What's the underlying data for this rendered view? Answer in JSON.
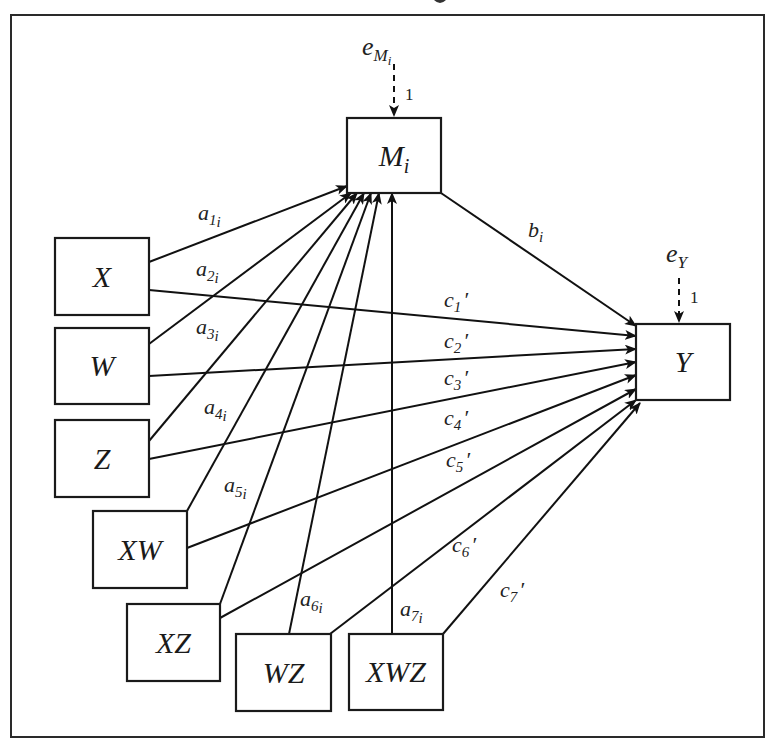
{
  "diagram": {
    "title_fragment": "",
    "frame": {
      "x": 11,
      "y": 15,
      "width": 753,
      "height": 722
    },
    "nodes": [
      {
        "id": "M",
        "label": "M",
        "sub": "i",
        "x": 347,
        "y": 118,
        "w": 94,
        "h": 75
      },
      {
        "id": "Y",
        "label": "Y",
        "sub": "",
        "x": 636,
        "y": 324,
        "w": 94,
        "h": 76
      },
      {
        "id": "X",
        "label": "X",
        "sub": "",
        "x": 55,
        "y": 238,
        "w": 94,
        "h": 77
      },
      {
        "id": "W",
        "label": "W",
        "sub": "",
        "x": 55,
        "y": 328,
        "w": 94,
        "h": 76
      },
      {
        "id": "Z",
        "label": "Z",
        "sub": "",
        "x": 55,
        "y": 420,
        "w": 94,
        "h": 77
      },
      {
        "id": "XW",
        "label": "XW",
        "sub": "",
        "x": 93,
        "y": 511,
        "w": 94,
        "h": 77
      },
      {
        "id": "XZ",
        "label": "XZ",
        "sub": "",
        "x": 127,
        "y": 604,
        "w": 93,
        "h": 77
      },
      {
        "id": "WZ",
        "label": "WZ",
        "sub": "",
        "x": 236,
        "y": 634,
        "w": 95,
        "h": 77
      },
      {
        "id": "XWZ",
        "label": "XWZ",
        "sub": "",
        "x": 349,
        "y": 634,
        "w": 94,
        "h": 76
      }
    ],
    "errors": [
      {
        "id": "eM",
        "label": "e",
        "sub": "M",
        "subsub": "i",
        "x": 362,
        "y": 55,
        "arrow_x": 394,
        "arrow_y1": 64,
        "arrow_y2": 116,
        "weight": "1",
        "wx": 405,
        "wy": 100
      },
      {
        "id": "eY",
        "label": "e",
        "sub": "Y",
        "subsub": "",
        "x": 666,
        "y": 262,
        "arrow_x": 679,
        "arrow_y1": 278,
        "arrow_y2": 322,
        "weight": "1",
        "wx": 690,
        "wy": 303
      }
    ],
    "edges": [
      {
        "from": "X",
        "to": "M",
        "x1": 149,
        "y1": 262,
        "x2": 347,
        "y2": 186,
        "label": "a",
        "sub": "1",
        "subsub": "i",
        "lx": 198,
        "ly": 220
      },
      {
        "from": "W",
        "to": "M",
        "x1": 149,
        "y1": 344,
        "x2": 351,
        "y2": 193,
        "label": "a",
        "sub": "2",
        "subsub": "i",
        "lx": 196,
        "ly": 276
      },
      {
        "from": "Z",
        "to": "M",
        "x1": 149,
        "y1": 441,
        "x2": 357,
        "y2": 193,
        "label": "a",
        "sub": "3",
        "subsub": "i",
        "lx": 196,
        "ly": 334
      },
      {
        "from": "XW",
        "to": "M",
        "x1": 187,
        "y1": 511,
        "x2": 364,
        "y2": 193,
        "label": "a",
        "sub": "4",
        "subsub": "i",
        "lx": 204,
        "ly": 414
      },
      {
        "from": "XZ",
        "to": "M",
        "x1": 220,
        "y1": 604,
        "x2": 371,
        "y2": 193,
        "label": "a",
        "sub": "5",
        "subsub": "i",
        "lx": 224,
        "ly": 492
      },
      {
        "from": "WZ",
        "to": "M",
        "x1": 289,
        "y1": 634,
        "x2": 379,
        "y2": 193,
        "label": "a",
        "sub": "6",
        "subsub": "i",
        "lx": 300,
        "ly": 606
      },
      {
        "from": "XWZ",
        "to": "M",
        "x1": 392,
        "y1": 634,
        "x2": 392,
        "y2": 193,
        "label": "a",
        "sub": "7",
        "subsub": "i",
        "lx": 400,
        "ly": 616
      },
      {
        "from": "M",
        "to": "Y",
        "x1": 441,
        "y1": 193,
        "x2": 636,
        "y2": 326,
        "label": "b",
        "sub": "i",
        "subsub": "",
        "lx": 528,
        "ly": 237
      },
      {
        "from": "X",
        "to": "Y",
        "x1": 149,
        "y1": 290,
        "x2": 636,
        "y2": 336,
        "label": "c",
        "sub": "1",
        "subsub": "",
        "prime": "′",
        "lx": 444,
        "ly": 307
      },
      {
        "from": "W",
        "to": "Y",
        "x1": 149,
        "y1": 376,
        "x2": 636,
        "y2": 349,
        "label": "c",
        "sub": "2",
        "subsub": "",
        "prime": "′",
        "lx": 444,
        "ly": 348
      },
      {
        "from": "Z",
        "to": "Y",
        "x1": 149,
        "y1": 459,
        "x2": 636,
        "y2": 362,
        "label": "c",
        "sub": "3",
        "subsub": "",
        "prime": "′",
        "lx": 444,
        "ly": 385
      },
      {
        "from": "XW",
        "to": "Y",
        "x1": 187,
        "y1": 548,
        "x2": 636,
        "y2": 375,
        "label": "c",
        "sub": "4",
        "subsub": "",
        "prime": "′",
        "lx": 444,
        "ly": 425
      },
      {
        "from": "XZ",
        "to": "Y",
        "x1": 220,
        "y1": 618,
        "x2": 636,
        "y2": 389,
        "label": "c",
        "sub": "5",
        "subsub": "",
        "prime": "′",
        "lx": 446,
        "ly": 467
      },
      {
        "from": "WZ",
        "to": "Y",
        "x1": 330,
        "y1": 634,
        "x2": 636,
        "y2": 400,
        "label": "c",
        "sub": "6",
        "subsub": "",
        "prime": "′",
        "lx": 452,
        "ly": 552
      },
      {
        "from": "XWZ",
        "to": "Y",
        "x1": 443,
        "y1": 634,
        "x2": 640,
        "y2": 403,
        "label": "c",
        "sub": "7",
        "subsub": "",
        "prime": "′",
        "lx": 500,
        "ly": 597
      }
    ]
  }
}
